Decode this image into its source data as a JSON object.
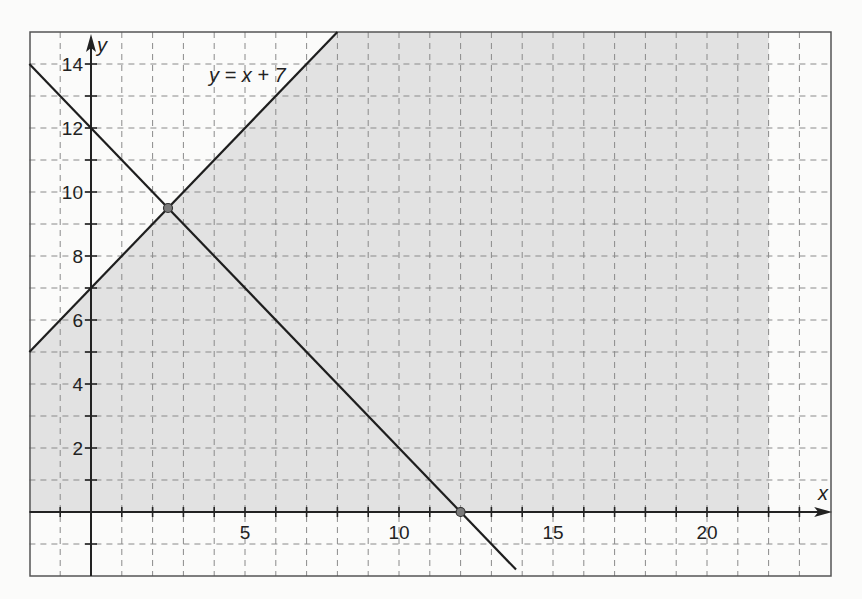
{
  "chart_data": {
    "type": "line",
    "title": "",
    "xlabel": "x",
    "ylabel": "y",
    "xlim": [
      -2,
      24
    ],
    "ylim": [
      -2,
      15
    ],
    "grid": true,
    "x_ticks": [
      5,
      10,
      15,
      20
    ],
    "y_ticks": [
      2,
      4,
      6,
      8,
      10,
      12,
      14
    ],
    "series": [
      {
        "name": "y = x + 7",
        "x": [
          -2,
          8
        ],
        "y": [
          5,
          15
        ]
      },
      {
        "name": "y = -x + 12",
        "x": [
          -2,
          13.8
        ],
        "y": [
          14,
          -1.8
        ]
      }
    ],
    "shaded_region": {
      "description": "feasible region: y <= x + 7, y >= 0, x <= 22",
      "vertices": [
        [
          -2,
          0
        ],
        [
          -2,
          5
        ],
        [
          8,
          15
        ],
        [
          22,
          15
        ],
        [
          22,
          0
        ]
      ],
      "color": "#e2e2e2"
    },
    "points": [
      {
        "x": 2.5,
        "y": 9.5
      },
      {
        "x": 12,
        "y": 0
      }
    ],
    "annotations": [
      {
        "text": "y = x + 7",
        "x": 4,
        "y": 13.5
      }
    ]
  },
  "labels": {
    "x_axis": "x",
    "y_axis": "y",
    "equation": "y = x + 7",
    "x_ticks": [
      "5",
      "10",
      "15",
      "20"
    ],
    "y_ticks": [
      "14",
      "12",
      "10",
      "8",
      "6",
      "4",
      "2"
    ]
  },
  "colors": {
    "shade": "#e2e2e2",
    "grid": "#8a8a8a",
    "line": "#1e1e1e",
    "point": "#7a7a7a"
  }
}
